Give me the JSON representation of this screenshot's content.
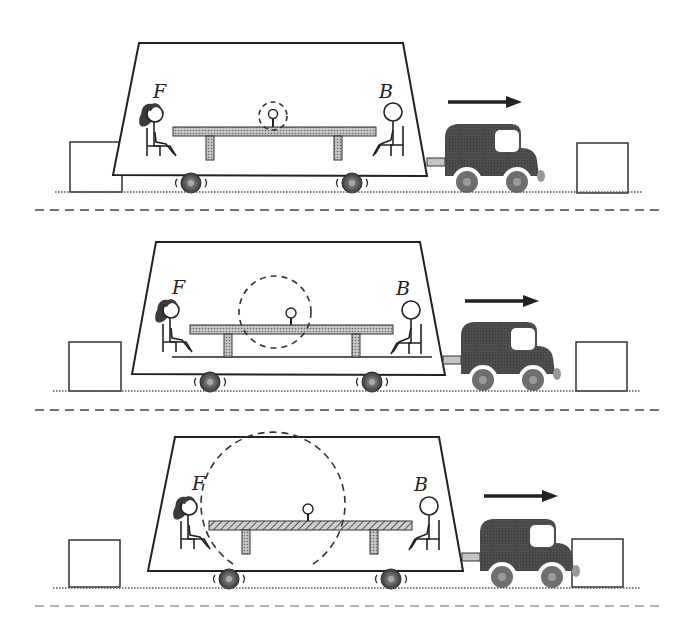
{
  "diagram": {
    "colors": {
      "outline": "#222222",
      "truck_body": "#4a4a4a",
      "wheel": "#6e6e6e",
      "table_fill": "#b5b5b5",
      "dashed_separator": "#555555",
      "background": "#ffffff"
    },
    "panels": [
      {
        "id": 1,
        "label_left": "F",
        "label_right": "B",
        "motion_arrow": "right-arrow",
        "ball_circle_radius": 14,
        "table_pattern": "dotted",
        "truck_position": "behind-right-box"
      },
      {
        "id": 2,
        "label_left": "F",
        "label_right": "B",
        "motion_arrow": "right-arrow",
        "ball_circle_radius": 47,
        "table_pattern": "dotted",
        "truck_position": "approaching-right-box"
      },
      {
        "id": 3,
        "label_left": "F",
        "label_right": "B",
        "motion_arrow": "right-arrow",
        "ball_circle_radius": 98,
        "table_pattern": "hatched",
        "truck_position": "overlapping-right-box"
      }
    ]
  }
}
